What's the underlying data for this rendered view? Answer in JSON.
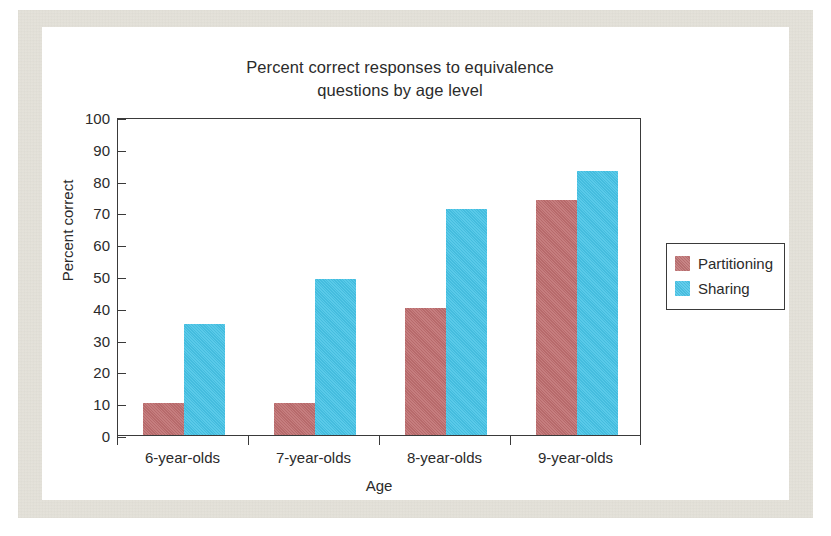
{
  "chart_data": {
    "type": "bar",
    "title": "Percent correct responses to equivalence questions by age level",
    "title_line1": "Percent correct responses to equivalence",
    "title_line2": "questions by age level",
    "xlabel": "Age",
    "ylabel": "Percent correct",
    "categories": [
      "6-year-olds",
      "7-year-olds",
      "8-year-olds",
      "9-year-olds"
    ],
    "series": [
      {
        "name": "Partitioning",
        "color": "#bf6f70",
        "values": [
          10,
          10,
          40,
          74
        ]
      },
      {
        "name": "Sharing",
        "color": "#47c4e7",
        "values": [
          35,
          49,
          71,
          83
        ]
      }
    ],
    "ylim": [
      0,
      100
    ],
    "ytick_step": 10,
    "yticks": [
      0,
      10,
      20,
      30,
      40,
      50,
      60,
      70,
      80,
      90,
      100
    ],
    "grid": false,
    "legend_position": "right-outside",
    "legend_entries": [
      "Partitioning",
      "Sharing"
    ]
  },
  "figure": {
    "frame_color": "#e8e6df",
    "plot_background": "#ffffff",
    "axis_color": "#3a3a3a"
  }
}
